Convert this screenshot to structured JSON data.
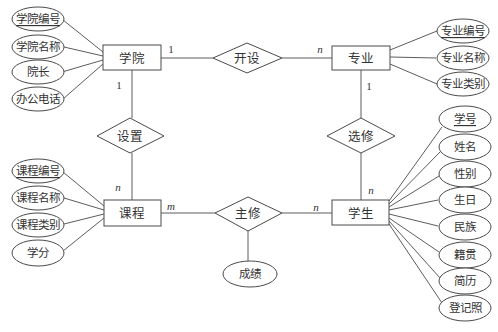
{
  "diagram": {
    "type": "ER diagram",
    "entities": {
      "college": {
        "label": "学院",
        "attributes": [
          "学院编号",
          "学院名称",
          "院长",
          "办公电话"
        ],
        "key": "学院编号"
      },
      "major": {
        "label": "专业",
        "attributes": [
          "专业编号",
          "专业名称",
          "专业类别"
        ],
        "key": "专业编号"
      },
      "course": {
        "label": "课程",
        "attributes": [
          "课程编号",
          "课程名称",
          "课程类别",
          "学分"
        ],
        "key": "课程编号"
      },
      "student": {
        "label": "学生",
        "attributes": [
          "学号",
          "姓名",
          "性别",
          "生日",
          "民族",
          "籍贯",
          "简历",
          "登记照"
        ],
        "key": "学号"
      }
    },
    "relationships": {
      "offer": {
        "label": "开设",
        "from": "学院",
        "to": "专业",
        "card_from": "1",
        "card_to": "n"
      },
      "setup": {
        "label": "设置",
        "from": "学院",
        "to": "课程",
        "card_from": "1",
        "card_to": "n"
      },
      "elect": {
        "label": "选修",
        "from": "专业",
        "to": "学生",
        "card_from": "1",
        "card_to": "n"
      },
      "major_study": {
        "label": "主修",
        "from": "课程",
        "to": "学生",
        "card_from": "m",
        "card_to": "n",
        "attributes": [
          "成绩"
        ]
      }
    }
  }
}
